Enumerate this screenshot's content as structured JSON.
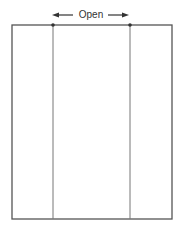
{
  "diagram": {
    "label": "Open",
    "stroke_color": "#555555"
  },
  "panels": [
    {
      "name": "left-panel"
    },
    {
      "name": "center-panel"
    },
    {
      "name": "right-panel"
    }
  ]
}
